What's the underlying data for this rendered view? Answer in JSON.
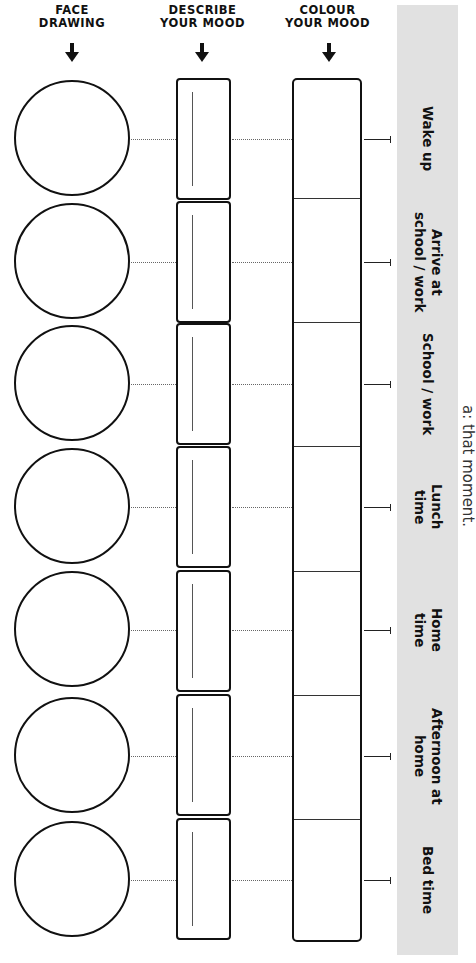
{
  "headers": {
    "face": "FACE\nDRAWING",
    "describe": "DESCRIBE\nYOUR MOOD",
    "colour": "COLOUR\nYOUR MOOD"
  },
  "rows": [
    {
      "label": "Wake up",
      "y": 139
    },
    {
      "label": "Arrive at\nschool / work",
      "y": 262
    },
    {
      "label": "School / work",
      "y": 384
    },
    {
      "label": "Lunch\ntime",
      "y": 507
    },
    {
      "label": "Home\ntime",
      "y": 630
    },
    {
      "label": "Afternoon at\nhome",
      "y": 756
    },
    {
      "label": "Bed time",
      "y": 880
    }
  ],
  "side_text": "a: that moment.",
  "colors": {
    "band": "#e1e1e1",
    "ink": "#111111"
  }
}
